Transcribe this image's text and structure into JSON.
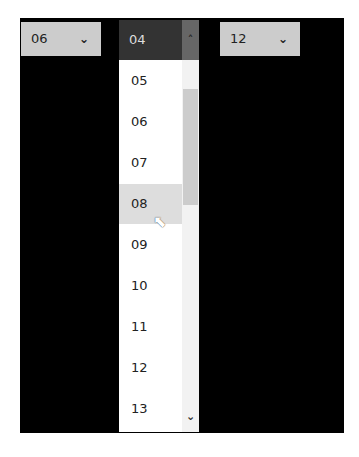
{
  "left_select": {
    "value": "06"
  },
  "right_select": {
    "value": "12"
  },
  "dropdown": {
    "selected": "04",
    "items": [
      "05",
      "06",
      "07",
      "08",
      "09",
      "10",
      "11",
      "12",
      "13"
    ],
    "hovered": "08"
  },
  "icons": {
    "chevron_down": "⌄",
    "chevron_up": "^",
    "cursor": "⬉"
  }
}
